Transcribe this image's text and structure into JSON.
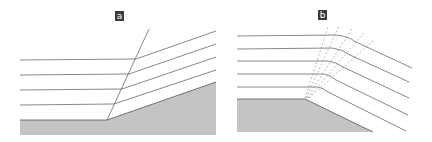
{
  "panels": [
    {
      "id": "a",
      "label": "a"
    },
    {
      "id": "b",
      "label": "b"
    }
  ],
  "colors": {
    "ground": "#c4c4c4",
    "line": "#4a4a4a",
    "dashed": "#8a8a8a",
    "label_bg": "#3a3a3a"
  }
}
